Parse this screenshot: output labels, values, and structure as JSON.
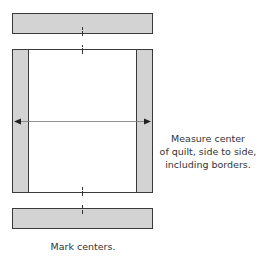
{
  "colors": {
    "border_fill": "#d3d3d3",
    "outline": "#3a3a3a",
    "quilt_fill": "#ffffff",
    "arrow": "#555555"
  },
  "annotations": {
    "measure_lines": [
      "Measure center",
      "of quilt, side to side,",
      "including borders."
    ],
    "mark_centers": "Mark centers."
  }
}
